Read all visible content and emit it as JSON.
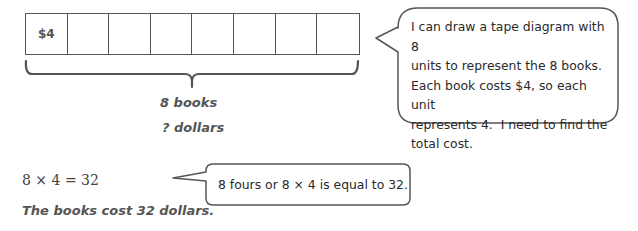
{
  "tape_diagram": {
    "units": 8,
    "cells": [
      "$4",
      "",
      "",
      "",
      "",
      "",
      "",
      ""
    ],
    "brace_label": "8 books",
    "unknown_label": "? dollars"
  },
  "bubble_top": {
    "lines": [
      "I can draw a tape diagram with 8",
      "units to represent the 8 books.",
      "Each book costs $4, so each unit",
      "represents 4.  I need to find the",
      "total cost."
    ]
  },
  "equation": "8 × 4 = 32",
  "bubble_bottom": {
    "text": "8 fours or 8 × 4 is equal to 32."
  },
  "conclusion": "The books cost 32 dollars.",
  "colors": {
    "stroke": "#555555",
    "text": "#3a3a3a"
  }
}
